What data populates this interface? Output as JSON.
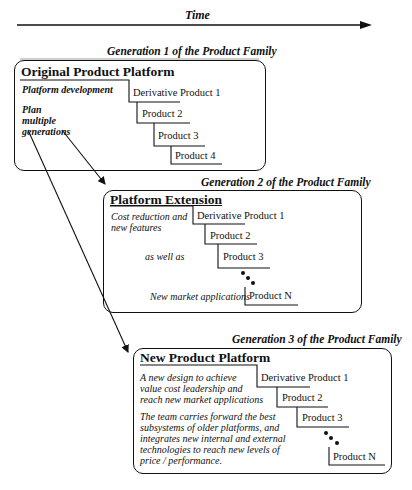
{
  "timeline": {
    "label": "Time"
  },
  "generations": [
    {
      "title": "Generation 1 of the Product Family",
      "platform": "Original Product Platform",
      "descriptions": [
        "Platform development",
        "Plan",
        "multiple",
        "generations"
      ],
      "products": [
        "Derivative Product 1",
        "Product 2",
        "Product 3",
        "Product 4"
      ]
    },
    {
      "title": "Generation 2 of the Product Family",
      "platform": "Platform Extension",
      "descriptions": [
        "Cost reduction and",
        "new features",
        "as well as",
        "New market applications"
      ],
      "products": [
        "Derivative Product 1",
        "Product 2",
        "Product 3",
        "Product N"
      ]
    },
    {
      "title": "Generation 3 of the Product Family",
      "platform": "New Product Platform",
      "descriptions": [
        "A new design to achieve",
        "value cost leadership and",
        "reach new market applications",
        "The team carries forward the best",
        "subsystems of older platforms, and",
        "integrates new internal and external",
        "technologies to reach new levels of",
        "price / performance."
      ],
      "products": [
        "Derivative Product 1",
        "Product 2",
        "Product 3",
        "Product N"
      ]
    }
  ],
  "icons": {
    "continuation": "ellipsis-dots",
    "arrows": "arrow-right"
  }
}
